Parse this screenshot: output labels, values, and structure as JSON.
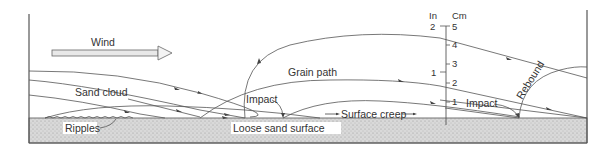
{
  "diagram": {
    "labels": {
      "wind": "Wind",
      "sand_cloud": "Sand cloud",
      "grain_path": "Grain path",
      "impact_left": "Impact",
      "impact_right": "Impact",
      "ripples": "Ripples",
      "loose_sand_surface": "Loose sand surface",
      "surface_creep": "Surface creep",
      "rebound": "Rebound"
    },
    "scale": {
      "inch_header": "In",
      "cm_header": "Cm",
      "inch_ticks": [
        "2",
        "1"
      ],
      "cm_ticks": [
        "5",
        "4",
        "3",
        "2",
        "1"
      ]
    },
    "colors": {
      "line": "#555555",
      "sand_fill": "#d6d6d6",
      "text": "#333333",
      "background": "#ffffff"
    }
  }
}
